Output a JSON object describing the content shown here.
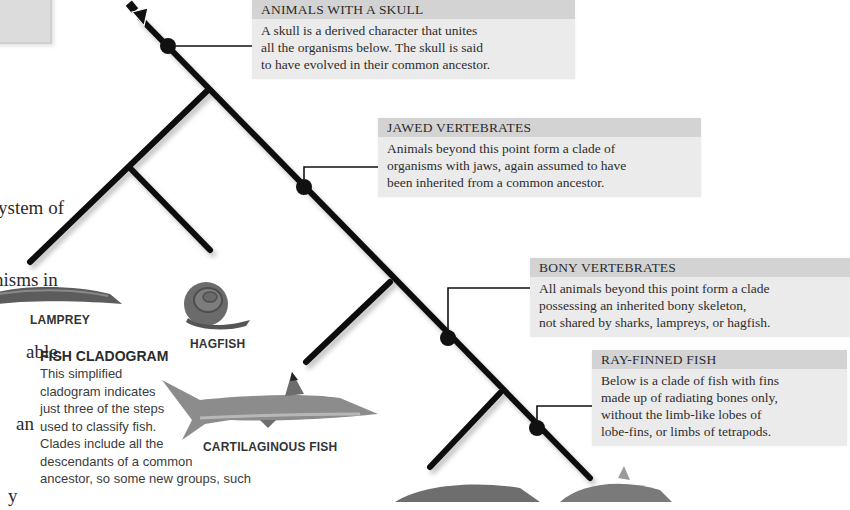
{
  "intro_text": {
    "lines": [
      "ystem of",
      "nisms in",
      "able.",
      "an",
      "y"
    ]
  },
  "callouts": [
    {
      "id": "skull",
      "heading": "ANIMALS WITH A SKULL",
      "lines": [
        "A skull is a derived character that unites",
        "all the organisms below. The skull is said",
        "to have evolved in their common ancestor."
      ]
    },
    {
      "id": "jawed",
      "heading": "JAWED VERTEBRATES",
      "lines": [
        "Animals beyond this point form a clade of",
        "organisms with jaws, again assumed to have",
        "been inherited from a common ancestor."
      ]
    },
    {
      "id": "bony",
      "heading": "BONY VERTEBRATES",
      "lines": [
        "All animals beyond this point form a clade",
        "possessing an inherited bony skeleton,",
        "not shared by sharks, lampreys, or hagfish."
      ]
    },
    {
      "id": "rayfinned",
      "heading": "RAY-FINNED FISH",
      "lines": [
        "Below is a clade of fish with fins",
        "made up of radiating bones only,",
        "without the limb-like lobes of",
        "lobe-fins, or limbs of tetrapods."
      ]
    }
  ],
  "organisms": {
    "lamprey": "LAMPREY",
    "hagfish": "HAGFISH",
    "cartilaginous": "CARTILAGINOUS FISH"
  },
  "fish_cladogram": {
    "title": "FISH CLADOGRAM",
    "lines": [
      "This simplified",
      "cladogram indicates",
      "just three of the steps",
      "used to classify fish.",
      "Clades include all the",
      "descendants of a common",
      "ancestor, so some new groups, such"
    ]
  },
  "colors": {
    "callout_bg": "#ebebeb",
    "callout_header_bg": "#d3d3d3",
    "tree_line": "#111111"
  }
}
